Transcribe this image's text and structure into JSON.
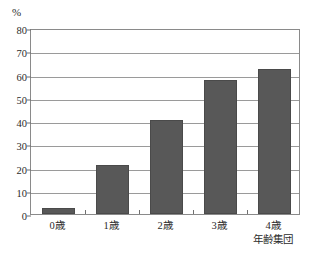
{
  "chart_data": {
    "type": "bar",
    "title": "",
    "subtitle": "",
    "unit_label": "%",
    "xlabel": "年齢集団",
    "ylabel": "",
    "categories": [
      "0歳",
      "1歳",
      "2歳",
      "3歳",
      "4歳"
    ],
    "values": [
      2.5,
      21.2,
      40.5,
      57.5,
      62.5
    ],
    "series": [
      {
        "name": "",
        "values": [
          2.5,
          21.2,
          40.5,
          57.5,
          62.5
        ]
      }
    ],
    "ylim": [
      0,
      80
    ],
    "ytick_labels": [
      "0",
      "10",
      "20",
      "30",
      "40",
      "50",
      "60",
      "70",
      "80"
    ],
    "ytick_values": [
      0,
      10,
      20,
      30,
      40,
      50,
      60,
      70,
      80
    ],
    "grid": true,
    "grid_axis": "y",
    "legend": false,
    "legend_position": "none",
    "bar_color": "#585858",
    "bar_border_color": "#4a4a4a",
    "grid_color": "#9a9a9a",
    "axis_color": "#8a8a8a",
    "plot_background": "#ffffff",
    "text_color": "#2b2b2b"
  }
}
